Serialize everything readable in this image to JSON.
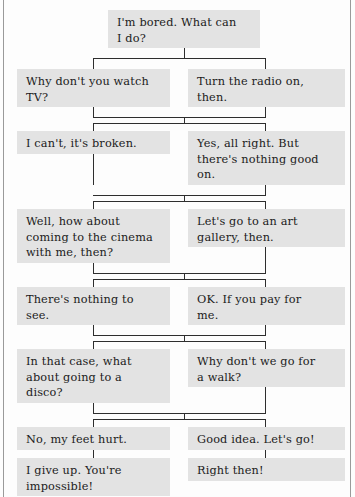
{
  "diagram": {
    "box_fill": "#e3e3e3",
    "text_color": "#1b1b1b",
    "connector_color": "#2e2e2e",
    "page_background": "#fdfdfd",
    "root": {
      "label": "I'm bored. What can\nI do?"
    },
    "rows": [
      {
        "left": "Why don't you watch\nTV?",
        "right": "Turn the radio on,\nthen."
      },
      {
        "left": "I can't, it's broken.",
        "right": "Yes, all right. But\nthere's nothing good\non."
      },
      {
        "left": "Well, how about\ncoming to the cinema\nwith me, then?",
        "right": "Let's go to an art\ngallery, then."
      },
      {
        "left": "There's nothing to\nsee.",
        "right": "OK. If you pay for\nme."
      },
      {
        "left": "In that case, what\nabout going to a\ndisco?",
        "right": "Why don't we go for\na walk?"
      },
      {
        "left": "No, my feet hurt.",
        "right": "Good idea. Let's go!"
      },
      {
        "left": "I give up. You're\nimpossible!",
        "right": "Right then!"
      }
    ]
  }
}
